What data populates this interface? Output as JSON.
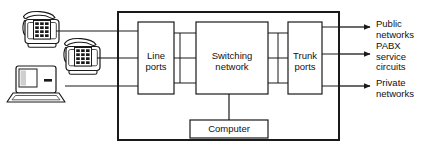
{
  "diagram": {
    "colors": {
      "stroke": "#1a1a1a",
      "text": "#111111",
      "background": "#ffffff",
      "icon_fill": "#ffffff",
      "icon_shadow": "#d8d8d8"
    },
    "frame": {
      "name": "pabx-enclosure",
      "x": 118,
      "y": 12,
      "width": 221,
      "height": 128
    },
    "blocks": [
      {
        "id": "line-ports",
        "label": "Line\nports",
        "x": 138,
        "y": 22,
        "width": 36,
        "height": 72
      },
      {
        "id": "switching-network",
        "label": "Switching\nnetwork",
        "x": 196,
        "y": 22,
        "width": 72,
        "height": 72
      },
      {
        "id": "trunk-ports",
        "label": "Trunk\nports",
        "x": 288,
        "y": 22,
        "width": 34,
        "height": 72
      },
      {
        "id": "computer",
        "label": "Computer",
        "x": 190,
        "y": 120,
        "width": 78,
        "height": 18
      }
    ],
    "inputs": [
      {
        "id": "desk-phone-upper",
        "icon": "telephone-icon",
        "line_y": 31,
        "icon_x": 16,
        "icon_y": 10
      },
      {
        "id": "desk-phone-lower",
        "icon": "telephone-icon",
        "line_y": 58,
        "icon_x": 57,
        "icon_y": 37
      },
      {
        "id": "computer-terminal",
        "icon": "desktop-computer-icon",
        "line_y": 86,
        "icon_x": 12,
        "icon_y": 64
      }
    ],
    "outputs": [
      {
        "id": "public-networks",
        "label": "Public\nnetworks",
        "arrow_y": 27,
        "text_x": 376,
        "text_y": 19
      },
      {
        "id": "pabx-service-circuits",
        "label": "PABX\nservice\ncircuits",
        "arrow_y": 54,
        "text_x": 376,
        "text_y": 41
      },
      {
        "id": "private-networks",
        "label": "Private\nnetworks",
        "arrow_y": 86,
        "text_x": 376,
        "text_y": 78
      }
    ],
    "internal_links": {
      "line_to_switch_ys": [
        33,
        58,
        83
      ],
      "switch_to_trunk_ys": [
        33,
        58,
        83
      ],
      "computer_stem": {
        "x": 229,
        "from_y": 94,
        "to_y": 120
      }
    }
  }
}
